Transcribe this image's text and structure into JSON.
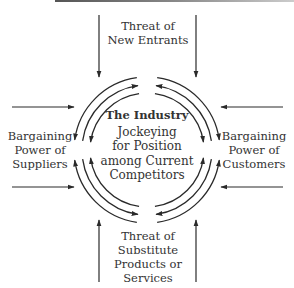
{
  "diagram": {
    "type": "five-forces",
    "center": {
      "title": "The Industry",
      "lines": [
        "Jockeying",
        "for Position",
        "among Current",
        "Competitors"
      ]
    },
    "forces": {
      "top": {
        "lines": [
          "Threat of",
          "New Entrants"
        ],
        "arrow_direction": "inward"
      },
      "bottom": {
        "lines": [
          "Threat of",
          "Substitute",
          "Products or",
          "Services"
        ],
        "arrow_direction": "inward"
      },
      "left": {
        "lines": [
          "Bargaining",
          "Power of",
          "Suppliers"
        ],
        "arrow_direction": "inward"
      },
      "right": {
        "lines": [
          "Bargaining",
          "Power of",
          "Customers"
        ],
        "arrow_direction": "inward"
      }
    },
    "colors": {
      "ink": "#2a2a2a",
      "background": "#ffffff"
    }
  }
}
